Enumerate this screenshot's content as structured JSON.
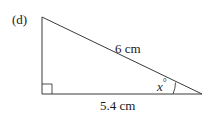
{
  "part_label": "(d)",
  "hypotenuse_label": "6 cm",
  "base_label": "5.4 cm",
  "angle_label": "x°",
  "angle_var": "x",
  "angle_unit": "°",
  "colors": {
    "stroke": "#3a3a3a",
    "text": "#1a1a1a"
  }
}
